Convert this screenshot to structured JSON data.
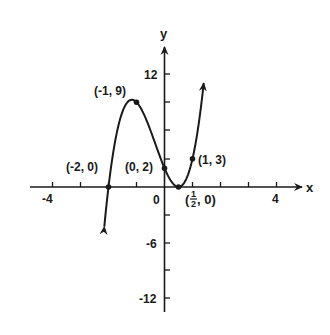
{
  "chart_data": {
    "type": "line",
    "title": "",
    "function": "f(x) = (x + 2)(2x - 1)^2",
    "xlabel": "x",
    "ylabel": "y",
    "xlim": [
      -4.5,
      4.8
    ],
    "ylim": [
      -13,
      15
    ],
    "x_ticks": [
      -4,
      -3,
      -2,
      -1,
      0,
      1,
      2,
      3,
      4
    ],
    "x_tick_labels": [
      {
        "value": -4,
        "label": "-4"
      },
      {
        "value": 0,
        "label": "0"
      },
      {
        "value": 4,
        "label": "4"
      }
    ],
    "y_ticks": [
      -12,
      -9,
      -6,
      -3,
      3,
      6,
      9,
      12
    ],
    "y_tick_labels": [
      {
        "value": 12,
        "label": "12"
      },
      {
        "value": -6,
        "label": "-6"
      },
      {
        "value": -12,
        "label": "-12"
      }
    ],
    "grid": false,
    "legend": null,
    "series": [
      {
        "name": "f(x)",
        "x": [
          -2.15,
          -2,
          -1.5,
          -1,
          -0.5,
          0,
          0.5,
          1,
          1.4
        ],
        "y": [
          -4.35,
          0,
          8,
          9,
          6,
          2,
          0,
          3,
          11
        ]
      }
    ],
    "annotated_points": [
      {
        "x": -2,
        "y": 0,
        "label": "(-2, 0)"
      },
      {
        "x": -1,
        "y": 9,
        "label": "(-1, 9)"
      },
      {
        "x": 0,
        "y": 2,
        "label": "(0, 2)"
      },
      {
        "x": 0.5,
        "y": 0,
        "label": "(1/2, 0)"
      },
      {
        "x": 1,
        "y": 3,
        "label": "(1, 3)"
      }
    ]
  },
  "labels": {
    "x_axis": "x",
    "y_axis": "y",
    "tick_neg4": "-4",
    "tick_0": "0",
    "tick_4": "4",
    "tick_12": "12",
    "tick_neg6": "-6",
    "tick_neg12": "-12",
    "pt_neg2_0": "(-2, 0)",
    "pt_neg1_9": "(-1, 9)",
    "pt_0_2": "(0, 2)",
    "pt_1_3": "(1, 3)",
    "pt_half_open": "(",
    "pt_half_num": "1",
    "pt_half_den": "2",
    "pt_half_close": ", 0)"
  },
  "colors": {
    "ink": "#1a1a1a",
    "background": "#ffffff"
  }
}
